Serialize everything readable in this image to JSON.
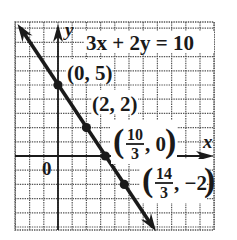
{
  "chart_data": {
    "type": "line",
    "title": "3x + 2y = 10",
    "equation": "3x + 2y = 10",
    "xlabel": "x",
    "ylabel": "y",
    "origin_label": "0",
    "xlim": [
      -3,
      11
    ],
    "ylim": [
      -5,
      9.4
    ],
    "grid": true,
    "grid_step": 1,
    "line": {
      "slope": -1.5,
      "intercept": 5,
      "from": [
        -2.85,
        9.3
      ],
      "to": [
        6.9,
        -5.3
      ]
    },
    "points": [
      {
        "x": 0,
        "y": 5,
        "label": "(0, 5)"
      },
      {
        "x": 2,
        "y": 2,
        "label": "(2, 2)"
      },
      {
        "x": 3.3333,
        "y": 0,
        "label_num": "10",
        "label_den": "3",
        "label_rest": ", 0"
      },
      {
        "x": 4.6667,
        "y": -2,
        "label_num": "14",
        "label_den": "3",
        "label_rest": ", −2"
      }
    ],
    "colors": {
      "line": "#1a1a1a",
      "grid": "#555555",
      "axis": "#1a1a1a",
      "background": "#ffffff"
    }
  }
}
